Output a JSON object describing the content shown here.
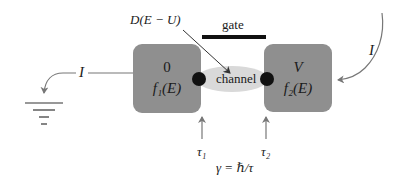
{
  "diagram": {
    "gate_label": "gate",
    "channel_label": "channel",
    "dos_label": "D(E − U)",
    "left_contact": {
      "potential": "0",
      "distribution": "f₁(E)"
    },
    "right_contact": {
      "potential": "V",
      "distribution": "f₂(E)"
    },
    "current_left": "I",
    "current_right": "I",
    "tau1": "τ₁",
    "tau2": "τ₂",
    "broadening": "γ = ℏ/τ",
    "colors": {
      "contact_fill": "#8f8f8f",
      "channel_fill": "#d9d9d9",
      "gate_bar": "#111111",
      "arrow": "#777777",
      "dot": "#111111"
    }
  }
}
